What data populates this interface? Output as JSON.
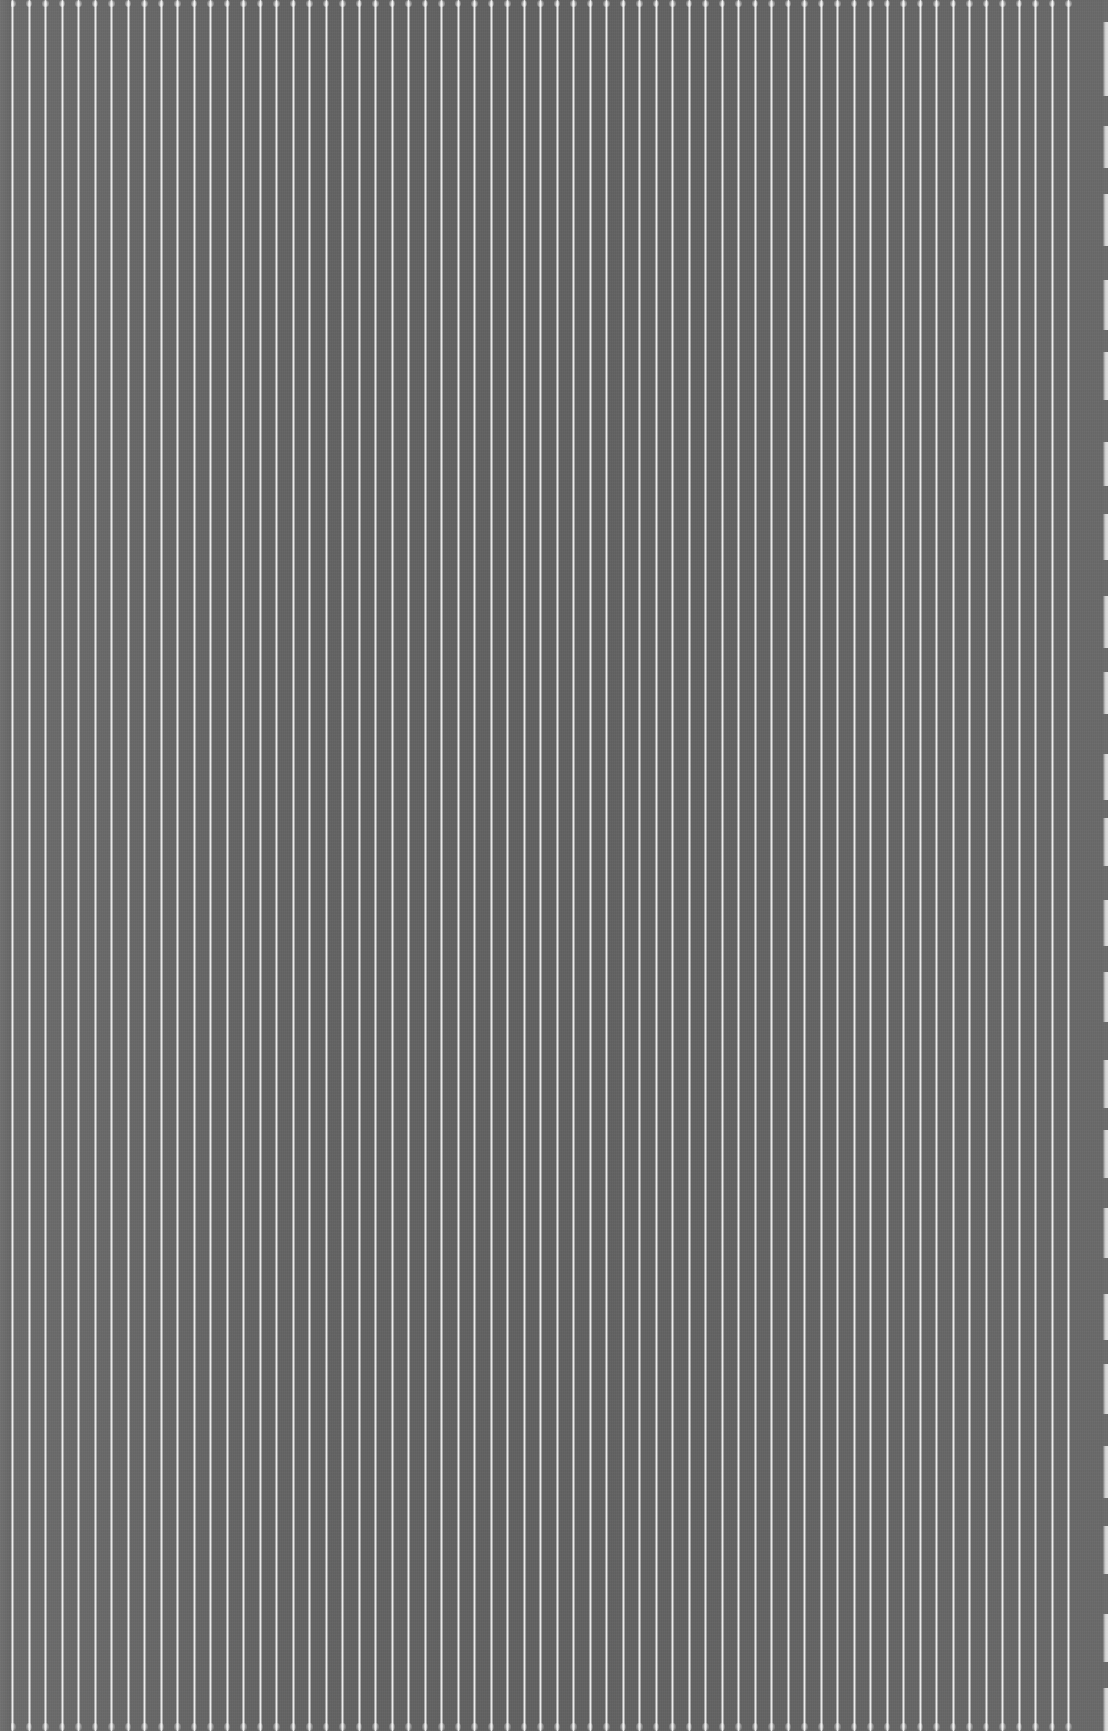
{
  "image": {
    "width": 1108,
    "height": 1731,
    "content_type": "abstract-striped-texture",
    "has_ui_elements": false,
    "has_text": false
  },
  "palette": {
    "ground": "#676767",
    "ground_center_shadow": "#5f5f5f",
    "ground_left_margin": "#717171",
    "stripe_light": "#f0f0f0",
    "stripe_core": "#f5f5f5",
    "right_edge_band": "#e6e6e6",
    "edge_notch": "#6c6c6c"
  },
  "pattern": {
    "orientation": "vertical",
    "stripe_count": 65,
    "stripe_width_px": 3,
    "gap_width_px": 13.5,
    "pitch_px": 16.5,
    "first_stripe_left_px": 11,
    "left_margin_px": 11,
    "stripe_top_cap_px": 7,
    "stripe_bottom_cap_px": 8,
    "stripe_runs_full_height": true,
    "grain_opacity": 0.3
  },
  "right_edge": {
    "band_left_px": 1103,
    "band_width_px": 5,
    "notches": [
      {
        "top": 0,
        "height": 22
      },
      {
        "top": 96,
        "height": 30
      },
      {
        "top": 168,
        "height": 26
      },
      {
        "top": 246,
        "height": 34
      },
      {
        "top": 330,
        "height": 22
      },
      {
        "top": 400,
        "height": 42
      },
      {
        "top": 486,
        "height": 28
      },
      {
        "top": 560,
        "height": 36
      },
      {
        "top": 648,
        "height": 24
      },
      {
        "top": 714,
        "height": 40
      },
      {
        "top": 800,
        "height": 18
      },
      {
        "top": 866,
        "height": 34
      },
      {
        "top": 946,
        "height": 26
      },
      {
        "top": 1022,
        "height": 38
      },
      {
        "top": 1108,
        "height": 22
      },
      {
        "top": 1178,
        "height": 30
      },
      {
        "top": 1258,
        "height": 36
      },
      {
        "top": 1340,
        "height": 24
      },
      {
        "top": 1414,
        "height": 32
      },
      {
        "top": 1498,
        "height": 28
      },
      {
        "top": 1574,
        "height": 40
      },
      {
        "top": 1662,
        "height": 26
      }
    ]
  }
}
